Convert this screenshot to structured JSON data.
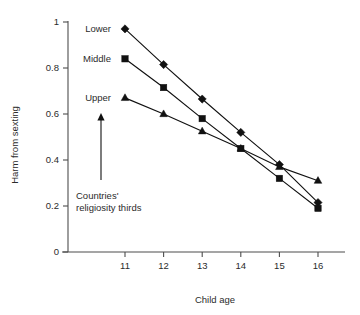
{
  "chart_data": {
    "type": "line",
    "title": "",
    "xlabel": "Child age",
    "ylabel": "Harm from sexting",
    "x": [
      11,
      12,
      13,
      14,
      15,
      16
    ],
    "xtick_labels": [
      "11",
      "12",
      "13",
      "14",
      "15",
      "16"
    ],
    "ytick_labels": [
      "0",
      "0.2",
      "0.4",
      "0.6",
      "0.8",
      "1"
    ],
    "ytick_values": [
      0,
      0.2,
      0.4,
      0.6,
      0.8,
      1
    ],
    "xlim": [
      10.5,
      16.5
    ],
    "ylim": [
      0,
      1
    ],
    "grid": false,
    "legend_position": "inside-upper-left",
    "series": [
      {
        "name": "Lower",
        "marker": "diamond",
        "values": [
          0.97,
          0.815,
          0.665,
          0.52,
          0.38,
          0.215
        ]
      },
      {
        "name": "Middle",
        "marker": "square",
        "values": [
          0.84,
          0.715,
          0.58,
          0.45,
          0.32,
          0.19
        ]
      },
      {
        "name": "Upper",
        "marker": "triangle",
        "values": [
          0.67,
          0.6,
          0.525,
          0.45,
          0.37,
          0.31
        ]
      }
    ],
    "annotations": [
      {
        "name": "religiosity-annotation",
        "line1": "Countries'",
        "line2": "religiosity thirds",
        "arrow": "up"
      }
    ]
  }
}
